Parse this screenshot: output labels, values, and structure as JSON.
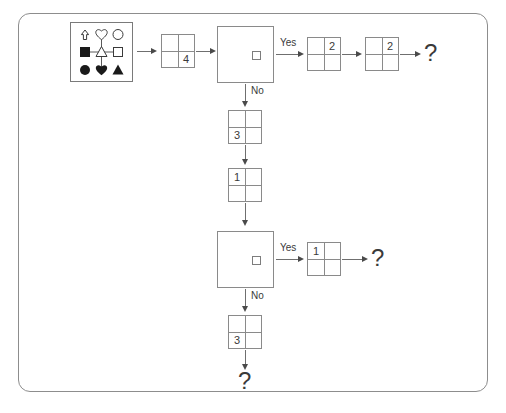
{
  "diagram": {
    "frame": {
      "name": "outer-frame"
    },
    "colors": {
      "stroke": "#8a8a8a",
      "frame_stroke": "#8d8d8d",
      "arrow": "#4a4a4a",
      "text": "#3a3a3a",
      "background": "#ffffff",
      "shape_fill": "#1a1a1a"
    },
    "legend_box": {
      "name": "shapes-legend-box",
      "rows": [
        {
          "symbols": [
            "arrow-up-outline",
            "heart-outline",
            "circle-outline"
          ]
        },
        {
          "symbols": [
            "square-filled",
            "triangle-outline",
            "square-outline"
          ]
        },
        {
          "symbols": [
            "circle-filled",
            "heart-filled",
            "triangle-filled"
          ]
        }
      ],
      "connectors": "horizontal line joining row-2 symbols, vertical line through center triangle"
    },
    "nodes": [
      {
        "id": "grid-4",
        "type": "grid2x2",
        "value": "4",
        "cell": "bottom-right"
      },
      {
        "id": "decision-1",
        "type": "decision",
        "marker": "small-square"
      },
      {
        "id": "grid-yes-1a",
        "type": "grid2x2",
        "value": "2",
        "cell": "top-right"
      },
      {
        "id": "grid-yes-1b",
        "type": "grid2x2",
        "value": "2",
        "cell": "top-right"
      },
      {
        "id": "question-1",
        "type": "question",
        "value": "?"
      },
      {
        "id": "grid-no-1",
        "type": "grid2x2",
        "value": "3",
        "cell": "bottom-left"
      },
      {
        "id": "grid-mid",
        "type": "grid2x2",
        "value": "1",
        "cell": "top-left"
      },
      {
        "id": "decision-2",
        "type": "decision",
        "marker": "small-square"
      },
      {
        "id": "grid-yes-2",
        "type": "grid2x2",
        "value": "1",
        "cell": "top-left"
      },
      {
        "id": "question-2",
        "type": "question",
        "value": "?"
      },
      {
        "id": "grid-no-2",
        "type": "grid2x2",
        "value": "3",
        "cell": "bottom-left"
      },
      {
        "id": "question-3",
        "type": "question",
        "value": "?"
      }
    ],
    "labels": {
      "yes_1": "Yes",
      "no_1": "No",
      "yes_2": "Yes",
      "no_2": "No"
    },
    "grid_values": {
      "g4": "4",
      "g2a": "2",
      "g2b": "2",
      "g3a": "3",
      "g1a": "1",
      "g1b": "1",
      "g3b": "3"
    },
    "question_marks": {
      "q1": "?",
      "q2": "?",
      "q3": "?"
    }
  }
}
